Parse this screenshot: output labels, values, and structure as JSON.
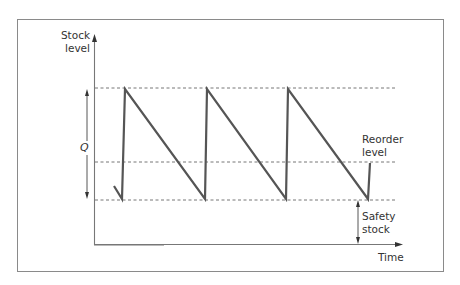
{
  "diagram": {
    "y_axis_label_line1": "Stock",
    "y_axis_label_line2": "level",
    "x_axis_label": "Time",
    "q_label": "Q",
    "reorder_label_line1": "Reorder",
    "reorder_label_line2": "level",
    "safety_label_line1": "Safety",
    "safety_label_line2": "stock",
    "colors": {
      "frame": "#8a8a8a",
      "axis": "#777777",
      "sawtooth": "#555555",
      "dashed": "#666666",
      "text": "#333333"
    },
    "levels": {
      "max_stock": "Safety stock + Q",
      "reorder_level": "Reorder level",
      "safety_stock": "Safety stock"
    },
    "cycles_shown": 3
  }
}
